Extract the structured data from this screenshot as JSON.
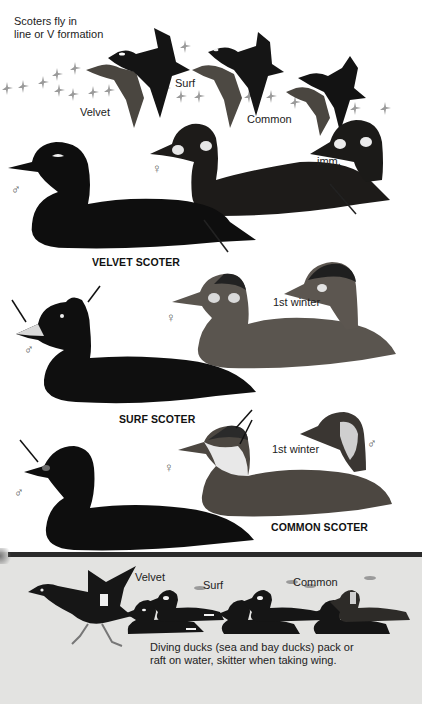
{
  "intro": {
    "line1": "Scoters fly in",
    "line2": "line or V formation"
  },
  "flight_labels": {
    "velvet": "Velvet",
    "surf": "Surf",
    "common": "Common"
  },
  "sections": [
    {
      "title": "VELVET SCOTER",
      "male_symbol": "♂",
      "female_symbol": "♀",
      "extra_label": "imm."
    },
    {
      "title": "SURF SCOTER",
      "male_symbol": "♂",
      "female_symbol": "♀",
      "extra_label": "1st winter"
    },
    {
      "title": "COMMON SCOTER",
      "male_symbol": "♂",
      "female_symbol": "♀",
      "extra_label": "1st winter",
      "extra_symbol": "♂"
    }
  ],
  "bottom_panel": {
    "labels": {
      "velvet": "Velvet",
      "surf": "Surf",
      "common": "Common"
    },
    "text_line1": "Diving ducks (sea and bay ducks) pack or",
    "text_line2": "raft on water, skitter when taking wing."
  },
  "colors": {
    "page_background": "#ffffff",
    "panel_background": "#e3e3e1",
    "panel_bar": "#2b2b2b",
    "bird_black": "#111111",
    "bird_brown": "#3a3530"
  }
}
